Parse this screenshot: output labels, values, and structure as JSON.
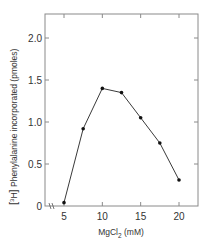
{
  "chart_data": {
    "type": "line",
    "title": "",
    "xlabel": "MgCl2 (mM)",
    "xlabel_main": "MgCl",
    "xlabel_sub": "2",
    "xlabel_unit": "(mM)",
    "ylabel": "[3H] Phenylalanine incorporated (pmoles)",
    "ylabel_bracket_iso": "3",
    "ylabel_bracket_el": "H",
    "ylabel_text": "Phenylalanine incorporated (pmoles)",
    "x": [
      5,
      7.5,
      10,
      12.5,
      15,
      17.5,
      20
    ],
    "series": [
      {
        "name": "[3H] Phenylalanine incorporated",
        "values": [
          0.04,
          0.92,
          1.4,
          1.35,
          1.05,
          0.75,
          0.31
        ]
      }
    ],
    "xlim": [
      3,
      22
    ],
    "ylim": [
      0,
      2.25
    ],
    "xticks": [
      5,
      10,
      15,
      20
    ],
    "xtick_labels": [
      "5",
      "10",
      "15",
      "20"
    ],
    "yticks": [
      0,
      0.5,
      1.0,
      1.5,
      2.0
    ],
    "ytick_labels": [
      "0",
      "0.5",
      "1.0",
      "1.5",
      "2.0"
    ],
    "axis_break": "x-axis break near origin",
    "grid": false,
    "legend": null
  },
  "colors": {
    "line": "#3a3a3a",
    "marker": "#111111",
    "axis": "#7a7a7a",
    "text": "#333333"
  }
}
